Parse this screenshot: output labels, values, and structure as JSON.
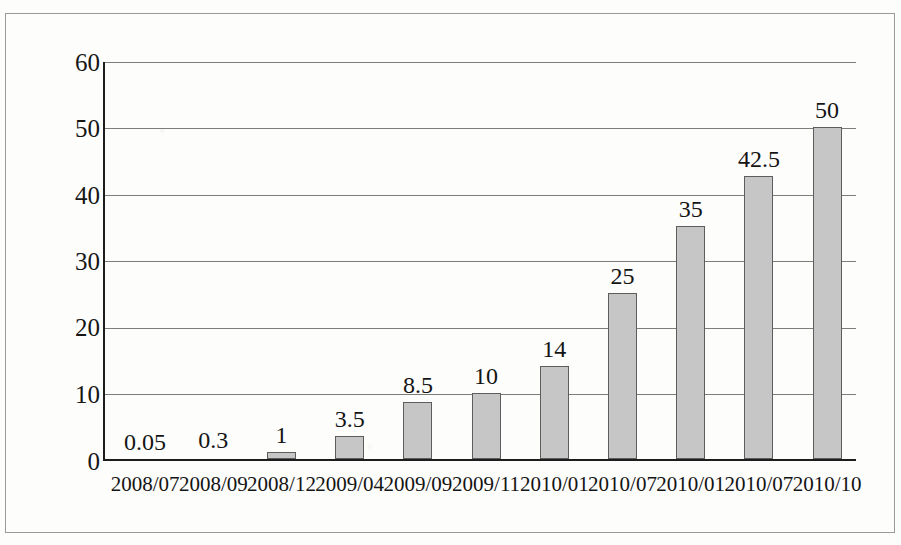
{
  "chart_data": {
    "type": "bar",
    "title": "",
    "subtitle": "",
    "xlabel": "",
    "ylabel": "",
    "categories": [
      "2008/07",
      "2008/09",
      "2008/12",
      "2009/04",
      "2009/09",
      "2009/11",
      "2010/01",
      "2010/07",
      "2010/01",
      "2010/07",
      "2010/10"
    ],
    "values": [
      0.05,
      0.3,
      1,
      3.5,
      8.5,
      10,
      14,
      25,
      35,
      42.5,
      50
    ],
    "value_labels": [
      "0.05",
      "0.3",
      "1",
      "3.5",
      "8.5",
      "10",
      "14",
      "25",
      "35",
      "42.5",
      "50"
    ],
    "ylim": [
      0,
      60
    ],
    "ytick_labels": [
      "60",
      "50",
      "40",
      "30",
      "20",
      "10",
      "0"
    ],
    "ytick_values": [
      60,
      50,
      40,
      30,
      20,
      10,
      0
    ],
    "grid": true,
    "grid_axis": "y",
    "legend": null,
    "legend_position": "none",
    "bar_fill_color": "#c6c6c6",
    "bar_border_color": "#5d5d5d",
    "axis_color": "#1d1d1d",
    "gridline_color": "#7d7d7a",
    "background_color": "#fdfdfc",
    "frame_color": "#9a9a96"
  }
}
